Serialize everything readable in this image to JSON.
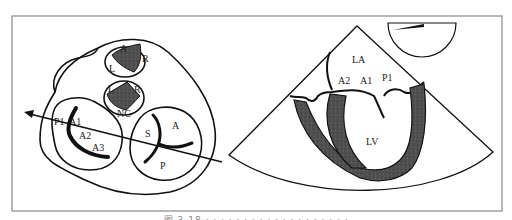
{
  "figure": {
    "left_panel": {
      "name": "Short-axis schematic of the heart valves with scan plane",
      "pulmonary_valve_labels": {
        "top": "A",
        "right": "R",
        "left": "L"
      },
      "aortic_valve_labels": {
        "left": "L",
        "right": "R",
        "bottom": "NC"
      },
      "mitral_valve_labels": [
        "P1",
        "A1",
        "A2",
        "A3"
      ],
      "tricuspid_valve_labels": {
        "septal": "S",
        "anterior": "A",
        "posterior": "P"
      }
    },
    "right_panel": {
      "name": "Echocardiographic sector view",
      "chamber_labels": {
        "atrium": "LA",
        "ventricle": "LV"
      },
      "leaflet_labels": [
        "A2",
        "A1",
        "P1"
      ]
    },
    "colors": {
      "stroke": "#111111",
      "fill_dark": "#4a4a4a",
      "frame": "#8a8a8a",
      "background": "#ffffff"
    },
    "caption": "图 3-18 · · · · · · · · · · · · · · · · · · ·"
  }
}
